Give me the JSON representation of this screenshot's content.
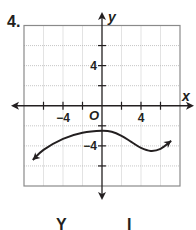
{
  "problem_number": "4.",
  "bottom_fragments": [
    "Y",
    "I"
  ],
  "chart_data": {
    "type": "line",
    "title": "",
    "xlabel": "x",
    "ylabel": "y",
    "origin_label": "O",
    "xlim": [
      -8,
      8
    ],
    "ylim": [
      -8,
      8
    ],
    "grid": true,
    "grid_step": 2,
    "x_ticks": [
      -6,
      -4,
      -2,
      2,
      4,
      6
    ],
    "y_ticks": [
      -6,
      -4,
      -2,
      2,
      4,
      6
    ],
    "x_tick_labels": [
      {
        "value": -4,
        "label": "−4"
      },
      {
        "value": 4,
        "label": "4"
      }
    ],
    "y_tick_labels": [
      {
        "value": 4,
        "label": "4"
      },
      {
        "value": -4,
        "label": "−4"
      }
    ],
    "legend": null,
    "series": [
      {
        "name": "curve",
        "arrows_both_ends": true,
        "points": [
          {
            "x": -7.1,
            "y": -5.4
          },
          {
            "x": -6,
            "y": -4.4
          },
          {
            "x": -4,
            "y": -3.3
          },
          {
            "x": -2,
            "y": -2.7
          },
          {
            "x": 0,
            "y": -2.5
          },
          {
            "x": 1,
            "y": -2.6
          },
          {
            "x": 2,
            "y": -3.0
          },
          {
            "x": 3,
            "y": -3.6
          },
          {
            "x": 4,
            "y": -4.2
          },
          {
            "x": 5,
            "y": -4.5
          },
          {
            "x": 6,
            "y": -4.3
          },
          {
            "x": 7.1,
            "y": -3.5
          }
        ]
      }
    ]
  },
  "colors": {
    "axis": "#231f20",
    "grid": "#b8b8b8",
    "border": "#8a8a8a",
    "curve": "#231f20"
  }
}
